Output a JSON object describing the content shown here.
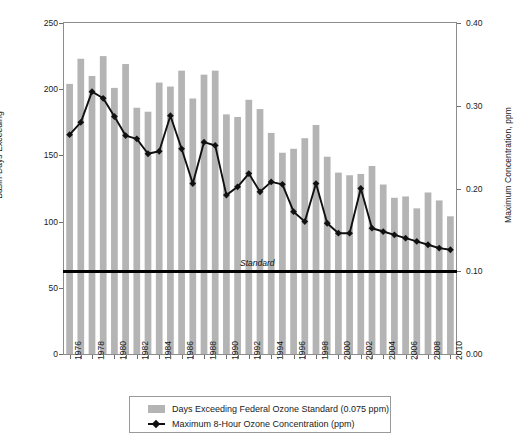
{
  "chart_data": {
    "type": "bar",
    "title": "",
    "xlabel": "",
    "ylabel": "Basin-Days Exceeding",
    "y2label": "Maximum Concentration, ppm",
    "ylim": [
      0,
      250
    ],
    "y2lim": [
      0.0,
      0.4
    ],
    "yticks": [
      "0",
      "50",
      "100",
      "150",
      "200",
      "250"
    ],
    "ytick_values": [
      0,
      50,
      100,
      150,
      200,
      250
    ],
    "y2ticks": [
      "0.00",
      "0.10",
      "0.20",
      "0.30",
      "0.40"
    ],
    "y2tick_values": [
      0.0,
      0.1,
      0.2,
      0.3,
      0.4
    ],
    "grid": false,
    "legend_position": "bottom",
    "categories": [
      "1976",
      "1977",
      "1978",
      "1979",
      "1980",
      "1981",
      "1982",
      "1983",
      "1984",
      "1985",
      "1986",
      "1987",
      "1988",
      "1989",
      "1990",
      "1991",
      "1992",
      "1993",
      "1994",
      "1995",
      "1996",
      "1997",
      "1998",
      "1999",
      "2000",
      "2001",
      "2002",
      "2003",
      "2004",
      "2005",
      "2006",
      "2007",
      "2008",
      "2009",
      "2010"
    ],
    "xtick_labels": [
      "1976",
      "1978",
      "1980",
      "1982",
      "1984",
      "1986",
      "1988",
      "1990",
      "1992",
      "1994",
      "1996",
      "1998",
      "2000",
      "2002",
      "2004",
      "2006",
      "2008",
      "2010"
    ],
    "series": [
      {
        "name": "Days Exceeding Federal Ozone Standard (0.075 ppm)",
        "kind": "bar",
        "axis": "left",
        "unit": "basin-days",
        "color": "#b4b4b4",
        "values": [
          204,
          223,
          210,
          225,
          201,
          219,
          186,
          183,
          205,
          202,
          214,
          193,
          211,
          214,
          181,
          179,
          192,
          185,
          167,
          152,
          155,
          163,
          173,
          149,
          137,
          135,
          136,
          142,
          128,
          118,
          119,
          110,
          122,
          116,
          104
        ]
      },
      {
        "name": "Maximum 8-Hour Ozone Concentration (ppm)",
        "kind": "line",
        "axis": "right",
        "unit": "ppm",
        "color": "#111111",
        "marker": "diamond",
        "values": [
          0.265,
          0.28,
          0.317,
          0.309,
          0.287,
          0.264,
          0.26,
          0.242,
          0.245,
          0.288,
          0.248,
          0.206,
          0.256,
          0.252,
          0.192,
          0.202,
          0.218,
          0.196,
          0.208,
          0.205,
          0.172,
          0.16,
          0.206,
          0.158,
          0.146,
          0.146,
          0.2,
          0.152,
          0.148,
          0.144,
          0.14,
          0.136,
          0.132,
          0.128,
          0.126
        ]
      }
    ],
    "annotations": [
      {
        "name": "standard-line",
        "label": "Standard",
        "axis": "right",
        "value": 0.1,
        "left_axis_equivalent": 62.5,
        "style": "solid-black-horizontal"
      }
    ]
  },
  "legend": {
    "entries": [
      {
        "label": "Days Exceeding Federal Ozone Standard (0.075 ppm)",
        "swatch": "bar"
      },
      {
        "label": "Maximum 8-Hour Ozone Concentration (ppm)",
        "swatch": "line-diamond"
      }
    ]
  },
  "colors": {
    "bar": "#b4b4b4",
    "line": "#111111",
    "frame": "#8d8d8d",
    "standard": "#000000",
    "background": "#ffffff"
  }
}
